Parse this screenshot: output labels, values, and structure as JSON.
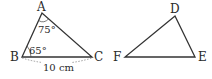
{
  "triangles": [
    {
      "name": "ABC",
      "vertices": {
        "A": "A",
        "B": "B",
        "C": "C"
      },
      "angles": {
        "A": "75°",
        "B": "65°"
      },
      "side_BC": "10 cm"
    },
    {
      "name": "DEF",
      "vertices": {
        "D": "D",
        "E": "E",
        "F": "F"
      }
    }
  ],
  "colors": {
    "line": "#333333",
    "text": "#2a2a2a"
  }
}
